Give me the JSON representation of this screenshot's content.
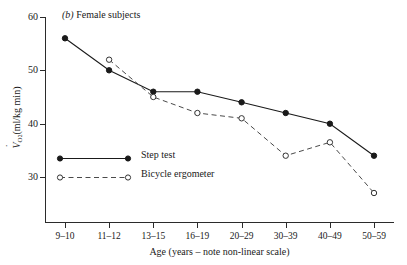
{
  "chart_data": {
    "type": "line",
    "title": "(b) Female subjects",
    "title_prefix_letter": "b",
    "xlabel": "Age (years – note non-linear scale)",
    "ylabel": "V̇O2 (ml/kg min)",
    "ylabel_symbol": "V",
    "ylabel_subscript": "O2",
    "ylabel_units": "(ml/kg min)",
    "categories": [
      "9–10",
      "11–12",
      "13–15",
      "16–19",
      "20–29",
      "30–39",
      "40–49",
      "50–59"
    ],
    "yticks": [
      30,
      40,
      50,
      60
    ],
    "ytick_labels": [
      "30",
      "40",
      "50",
      "60"
    ],
    "ylim": [
      24,
      60
    ],
    "xlim_note": "non-linear categorical axis, 8 evenly spaced positions",
    "grid": false,
    "legend_position": "inside lower-left",
    "series": [
      {
        "name": "Step test",
        "marker": "filled-circle",
        "linestyle": "solid",
        "color": "#1a1a1a",
        "values": [
          56,
          50,
          46,
          46,
          44,
          42,
          40,
          34
        ]
      },
      {
        "name": "Bicycle ergometer",
        "marker": "open-circle",
        "linestyle": "dashed",
        "color": "#4a4a4a",
        "values": [
          null,
          52,
          45,
          42,
          41,
          34,
          36.5,
          27
        ]
      }
    ]
  },
  "legend": {
    "items": [
      {
        "label": "Step test"
      },
      {
        "label": "Bicycle ergometer"
      }
    ]
  }
}
